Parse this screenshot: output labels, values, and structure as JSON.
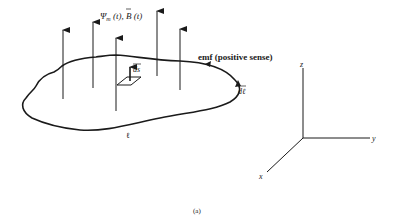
{
  "figure": {
    "caption": "(a)",
    "flux_label": "Ψm(t), B(t)",
    "flux_psi": "Ψ",
    "flux_sub": "m",
    "flux_t1": " (t), ",
    "flux_B": "B",
    "flux_t2": " (t)",
    "emf_label": "emf (positive sense)",
    "ds_label": "ds",
    "dl_label": "dℓ",
    "path_label": "ℓ",
    "axes": {
      "z": "z",
      "y": "y",
      "x": "x"
    },
    "colors": {
      "ink": "#1a1a1a",
      "background": "#ffffff"
    }
  }
}
